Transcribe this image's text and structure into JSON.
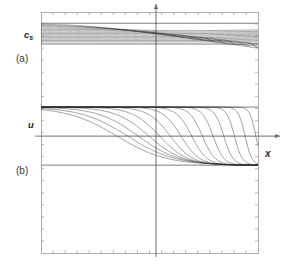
{
  "figure": {
    "labels": {
      "y_upper_main": "c",
      "y_upper_sub": "s",
      "y_lower": "u",
      "x_axis": "x",
      "panel_a": "(a)",
      "panel_b": "(b)"
    },
    "colors": {
      "curve": "#333333",
      "frame": "#a8a8a8",
      "axis": "#6f6f6f",
      "background": "#ffffff",
      "text": "#2b2b2b"
    }
  },
  "chart_data": {
    "type": "line",
    "title": "",
    "subtitle": "",
    "xlabel": "x",
    "ylabel": "",
    "grid": false,
    "legend": null,
    "panels": [
      {
        "id": "a",
        "label": "(a)",
        "ylabel": "c_s",
        "description": "Family of sound-speed profiles c_s(x) at successive times; curves form a narrow band near the top of the frame, dipping slightly near the origin and steepening into near-vertical fronts on the right half.",
        "baseline_y": 0.93,
        "band_top": 0.97,
        "band_bottom": 0.86,
        "n_curves": 14,
        "series": [
          {
            "name": "t1",
            "x": [
              -1.0,
              -0.8,
              -0.6,
              -0.4,
              -0.2,
              0.0,
              0.2,
              0.4,
              0.6,
              0.8,
              1.0
            ],
            "values": [
              0.965,
              0.963,
              0.96,
              0.956,
              0.951,
              0.945,
              0.94,
              0.936,
              0.933,
              0.931,
              0.93
            ]
          },
          {
            "name": "t2",
            "x": [
              -1.0,
              -0.8,
              -0.6,
              -0.4,
              -0.2,
              0.0,
              0.2,
              0.4,
              0.6,
              0.8,
              1.0
            ],
            "values": [
              0.962,
              0.959,
              0.955,
              0.95,
              0.943,
              0.936,
              0.93,
              0.927,
              0.925,
              0.924,
              0.924
            ]
          },
          {
            "name": "t3",
            "x": [
              -1.0,
              -0.8,
              -0.6,
              -0.4,
              -0.2,
              0.0,
              0.2,
              0.4,
              0.6,
              0.8,
              1.0
            ],
            "values": [
              0.959,
              0.955,
              0.95,
              0.943,
              0.935,
              0.927,
              0.921,
              0.918,
              0.917,
              0.917,
              0.918
            ]
          },
          {
            "name": "t4",
            "x": [
              -1.0,
              -0.8,
              -0.6,
              -0.4,
              -0.2,
              0.0,
              0.2,
              0.4,
              0.6,
              0.8,
              1.0
            ],
            "values": [
              0.956,
              0.951,
              0.945,
              0.937,
              0.927,
              0.918,
              0.912,
              0.91,
              0.91,
              0.912,
              0.915
            ]
          },
          {
            "name": "t5",
            "x": [
              -1.0,
              -0.8,
              -0.6,
              -0.4,
              -0.2,
              0.0,
              0.2,
              0.4,
              0.6,
              0.8,
              1.0
            ],
            "values": [
              0.953,
              0.947,
              0.94,
              0.93,
              0.919,
              0.909,
              0.903,
              0.902,
              0.904,
              0.908,
              0.914
            ]
          },
          {
            "name": "t6",
            "x": [
              -1.0,
              -0.8,
              -0.6,
              -0.4,
              -0.2,
              0.0,
              0.2,
              0.4,
              0.6,
              0.8,
              1.0
            ],
            "values": [
              0.95,
              0.943,
              0.934,
              0.923,
              0.911,
              0.9,
              0.895,
              0.895,
              0.899,
              0.906,
              0.914
            ]
          },
          {
            "name": "t7",
            "x": [
              -1.0,
              -0.8,
              -0.6,
              -0.4,
              -0.2,
              0.0,
              0.2,
              0.4,
              0.6,
              0.8,
              1.0
            ],
            "values": [
              0.947,
              0.939,
              0.929,
              0.917,
              0.903,
              0.892,
              0.887,
              0.889,
              0.895,
              0.904,
              0.914
            ]
          },
          {
            "name": "t8",
            "x": [
              -1.0,
              -0.8,
              -0.6,
              -0.4,
              -0.2,
              0.0,
              0.2,
              0.4,
              0.6,
              0.8,
              1.0
            ],
            "values": [
              0.944,
              0.935,
              0.924,
              0.91,
              0.896,
              0.884,
              0.88,
              0.883,
              0.891,
              0.902,
              0.914
            ]
          },
          {
            "name": "t9",
            "x": [
              -1.0,
              -0.8,
              -0.6,
              -0.4,
              -0.2,
              0.0,
              0.2,
              0.4,
              0.6,
              0.8,
              1.0
            ],
            "values": [
              0.941,
              0.931,
              0.919,
              0.905,
              0.889,
              0.877,
              0.873,
              0.878,
              0.888,
              0.901,
              0.914
            ]
          },
          {
            "name": "t10",
            "x": [
              -1.0,
              -0.8,
              -0.6,
              -0.4,
              -0.2,
              0.0,
              0.2,
              0.4,
              0.6,
              0.8,
              1.0
            ],
            "values": [
              0.938,
              0.928,
              0.915,
              0.899,
              0.883,
              0.871,
              0.868,
              0.874,
              0.885,
              0.9,
              0.914
            ]
          },
          {
            "name": "t11",
            "x": [
              -1.0,
              -0.8,
              -0.6,
              -0.4,
              -0.2,
              0.0,
              0.2,
              0.4,
              0.6,
              0.8,
              1.0
            ],
            "values": [
              0.936,
              0.924,
              0.911,
              0.894,
              0.878,
              0.866,
              0.864,
              0.871,
              0.883,
              0.899,
              0.914
            ]
          },
          {
            "name": "t12",
            "x": [
              -1.0,
              -0.8,
              -0.6,
              -0.4,
              -0.2,
              0.0,
              0.2,
              0.4,
              0.6,
              0.8,
              1.0
            ],
            "values": [
              0.933,
              0.921,
              0.907,
              0.89,
              0.873,
              0.862,
              0.861,
              0.869,
              0.882,
              0.899,
              0.914
            ]
          },
          {
            "name": "t13",
            "x": [
              -1.0,
              -0.8,
              -0.6,
              -0.4,
              -0.2,
              0.0,
              0.2,
              0.4,
              0.6,
              0.8,
              1.0
            ],
            "values": [
              0.931,
              0.919,
              0.904,
              0.886,
              0.869,
              0.859,
              0.859,
              0.867,
              0.881,
              0.898,
              0.914
            ]
          },
          {
            "name": "t14",
            "x": [
              -1.0,
              -0.8,
              -0.6,
              -0.4,
              -0.2,
              0.0,
              0.2,
              0.4,
              0.6,
              0.8,
              1.0
            ],
            "values": [
              0.929,
              0.916,
              0.901,
              0.883,
              0.866,
              0.857,
              0.857,
              0.866,
              0.88,
              0.898,
              0.914
            ]
          }
        ]
      },
      {
        "id": "b",
        "label": "(b)",
        "ylabel": "u",
        "description": "Family of velocity profiles u(x) at successive times. Each curve starts at an upper plateau on the left, falls through u=0 in a tanh-like front, reaches a lower plateau, and returns; the front steepens and migrates rightward with time, developing a near-vertical shock.",
        "baseline_y": 0.0,
        "band_top": 0.62,
        "band_bottom": -0.62,
        "n_curves": 14,
        "series": [
          {
            "name": "t1",
            "x": [
              -1.0,
              -0.75,
              -0.5,
              -0.25,
              0.0,
              0.25,
              0.5,
              0.75,
              1.0
            ],
            "values": [
              0.55,
              0.42,
              0.22,
              -0.02,
              -0.26,
              -0.44,
              -0.54,
              -0.58,
              -0.6
            ]
          },
          {
            "name": "t2",
            "x": [
              -1.0,
              -0.75,
              -0.5,
              -0.25,
              0.0,
              0.25,
              0.5,
              0.75,
              1.0
            ],
            "values": [
              0.58,
              0.48,
              0.3,
              0.06,
              -0.2,
              -0.4,
              -0.52,
              -0.57,
              -0.6
            ]
          },
          {
            "name": "t3",
            "x": [
              -1.0,
              -0.75,
              -0.5,
              -0.25,
              0.0,
              0.25,
              0.5,
              0.75,
              1.0
            ],
            "values": [
              0.59,
              0.52,
              0.37,
              0.14,
              -0.13,
              -0.36,
              -0.5,
              -0.56,
              -0.6
            ]
          },
          {
            "name": "t4",
            "x": [
              -1.0,
              -0.75,
              -0.5,
              -0.25,
              0.0,
              0.25,
              0.5,
              0.75,
              1.0
            ],
            "values": [
              0.6,
              0.55,
              0.43,
              0.23,
              -0.04,
              -0.31,
              -0.47,
              -0.55,
              -0.6
            ]
          },
          {
            "name": "t5",
            "x": [
              -1.0,
              -0.75,
              -0.5,
              -0.25,
              0.0,
              0.25,
              0.5,
              0.75,
              1.0
            ],
            "values": [
              0.6,
              0.57,
              0.48,
              0.32,
              0.06,
              -0.24,
              -0.44,
              -0.54,
              -0.6
            ]
          },
          {
            "name": "t6",
            "x": [
              -1.0,
              -0.75,
              -0.5,
              -0.25,
              0.0,
              0.25,
              0.5,
              0.75,
              1.0
            ],
            "values": [
              0.6,
              0.58,
              0.52,
              0.4,
              0.17,
              -0.15,
              -0.4,
              -0.53,
              -0.59
            ]
          },
          {
            "name": "t7",
            "x": [
              -1.0,
              -0.75,
              -0.5,
              -0.25,
              0.0,
              0.25,
              0.5,
              0.75,
              1.0
            ],
            "values": [
              0.6,
              0.59,
              0.55,
              0.46,
              0.28,
              -0.04,
              -0.34,
              -0.51,
              -0.59
            ]
          },
          {
            "name": "t8",
            "x": [
              -1.0,
              -0.75,
              -0.5,
              -0.25,
              0.0,
              0.25,
              0.5,
              0.75,
              1.0
            ],
            "values": [
              0.6,
              0.6,
              0.57,
              0.51,
              0.38,
              0.09,
              -0.26,
              -0.48,
              -0.58
            ]
          },
          {
            "name": "t9",
            "x": [
              -1.0,
              -0.75,
              -0.5,
              -0.25,
              0.0,
              0.25,
              0.5,
              0.75,
              1.0
            ],
            "values": [
              0.6,
              0.6,
              0.58,
              0.55,
              0.46,
              0.23,
              -0.15,
              -0.44,
              -0.57
            ]
          },
          {
            "name": "t10",
            "x": [
              -1.0,
              -0.75,
              -0.5,
              -0.25,
              0.0,
              0.25,
              0.5,
              0.75,
              1.0
            ],
            "values": [
              0.6,
              0.6,
              0.59,
              0.57,
              0.52,
              0.37,
              0.01,
              -0.37,
              -0.56
            ]
          },
          {
            "name": "t11",
            "x": [
              -1.0,
              -0.75,
              -0.5,
              -0.25,
              0.0,
              0.25,
              0.5,
              0.75,
              1.0
            ],
            "values": [
              0.6,
              0.6,
              0.6,
              0.58,
              0.56,
              0.48,
              0.2,
              -0.26,
              -0.53
            ]
          },
          {
            "name": "t12",
            "x": [
              -1.0,
              -0.75,
              -0.5,
              -0.25,
              0.0,
              0.25,
              0.5,
              0.75,
              1.0
            ],
            "values": [
              0.6,
              0.6,
              0.6,
              0.59,
              0.58,
              0.55,
              0.4,
              -0.07,
              -0.48
            ]
          },
          {
            "name": "t13",
            "x": [
              -1.0,
              -0.75,
              -0.5,
              -0.25,
              0.0,
              0.25,
              0.5,
              0.75,
              1.0
            ],
            "values": [
              0.6,
              0.6,
              0.6,
              0.6,
              0.59,
              0.58,
              0.52,
              0.2,
              -0.38
            ]
          },
          {
            "name": "t14",
            "x": [
              -1.0,
              -0.75,
              -0.5,
              -0.25,
              0.0,
              0.25,
              0.5,
              0.75,
              1.0
            ],
            "values": [
              0.6,
              0.6,
              0.6,
              0.6,
              0.6,
              0.59,
              0.57,
              0.45,
              -0.18
            ]
          }
        ]
      }
    ],
    "axes": {
      "x_arrow": true,
      "y_arrow": true,
      "x_origin_frac": 0.53,
      "y_origin_frac": 0.515,
      "frame": {
        "left": 41,
        "top": 12,
        "right": 258,
        "bottom": 253
      },
      "ticks": {
        "top": 18,
        "bottom": 18,
        "left": 20,
        "right": 20,
        "length": 3
      }
    }
  }
}
